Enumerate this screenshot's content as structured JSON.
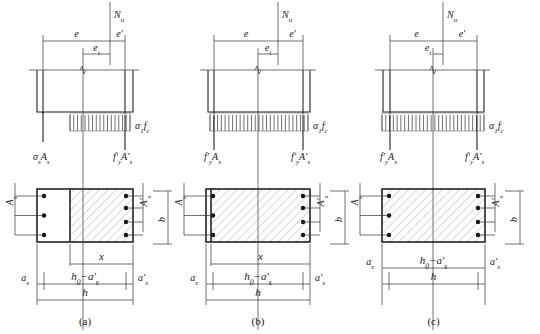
{
  "figure": {
    "panels": [
      {
        "id": "a",
        "caption": "(a)",
        "ox": 0,
        "force": {
          "label_N": "N",
          "label_N_sub": "u",
          "x": 110
        },
        "axis_x": 83,
        "dims_top": {
          "e": "e",
          "e_prime": "e′",
          "e1": "e",
          "e1_sub": "i",
          "left": 43,
          "right": 125,
          "e1_left": 83
        },
        "section_top": {
          "left": 37,
          "right": 133,
          "top": 70,
          "bottom": 112,
          "bar_left": 43,
          "bar_right": 125
        },
        "stress_block": {
          "left": 70,
          "right": 130
        },
        "labels": {
          "left_force": "σ",
          "left_force_sub": "s",
          "left_force_rest": "A",
          "left_force_rest_sub": "s",
          "left_is_tension": true,
          "right_force": "f′",
          "right_force_sub": "y",
          "right_force_rest": "A′",
          "right_force_rest_sub": "s",
          "alpha": "α",
          "alpha_sub": "1",
          "fc": "f",
          "fc_sub": "c"
        },
        "cross_section": {
          "left": 37,
          "right": 133,
          "top": 189,
          "bottom": 242,
          "hatch_left": 70
        },
        "dim_labels": {
          "x": "x",
          "h0a": "h",
          "h0a_sub": "0",
          "h0a_rest": "−a′",
          "h0a_rest_sub": "s",
          "as": "a",
          "as_sub": "s",
          "as_p": "a′",
          "as_p_sub": "s",
          "h": "h",
          "b": "b",
          "As": "A",
          "As_sub": "s",
          "Asp": "A′",
          "Asp_sub": "s"
        }
      },
      {
        "id": "b",
        "caption": "(b)",
        "ox": 180,
        "force": {
          "label_N": "N",
          "label_N_sub": "u",
          "x": 98
        },
        "axis_x": 78,
        "dims_top": {
          "e": "e",
          "e_prime": "e′",
          "e1": "e",
          "e1_sub": "i",
          "left": 34,
          "right": 123,
          "e1_left": 78
        },
        "section_top": {
          "left": 28,
          "right": 130,
          "top": 70,
          "bottom": 112,
          "bar_left": 34,
          "bar_right": 123
        },
        "stress_block": {
          "left": 30,
          "right": 128
        },
        "labels": {
          "left_force": "f′",
          "left_force_sub": "y",
          "left_force_rest": "A",
          "left_force_rest_sub": "s",
          "left_is_tension": false,
          "right_force": "f′",
          "right_force_sub": "y",
          "right_force_rest": "A′",
          "right_force_rest_sub": "s",
          "alpha": "α",
          "alpha_sub": "1",
          "fc": "f",
          "fc_sub": "c"
        },
        "cross_section": {
          "left": 26,
          "right": 130,
          "top": 189,
          "bottom": 242,
          "hatch_left": 31
        },
        "dim_labels": {
          "x": "x",
          "h0a": "h",
          "h0a_sub": "0",
          "h0a_rest": "−a′",
          "h0a_rest_sub": "s",
          "as": "a",
          "as_sub": "s",
          "as_p": "a′",
          "as_p_sub": "s",
          "h": "h",
          "b": "b",
          "As": "A",
          "As_sub": "s",
          "Asp": "A′",
          "Asp_sub": "s"
        }
      },
      {
        "id": "c",
        "caption": "(c)",
        "ox": 360,
        "force": {
          "label_N": "N",
          "label_N_sub": "u",
          "x": 83
        },
        "axis_x": 73,
        "dims_top": {
          "e": "e",
          "e_prime": "e′",
          "e1": "e",
          "e1_sub": "i",
          "left": 30,
          "right": 117,
          "e1_left": 73
        },
        "section_top": {
          "left": 23,
          "right": 124,
          "top": 70,
          "bottom": 112,
          "bar_left": 30,
          "bar_right": 117
        },
        "stress_block": {
          "left": 22,
          "right": 124
        },
        "labels": {
          "left_force": "f′",
          "left_force_sub": "y",
          "left_force_rest": "A",
          "left_force_rest_sub": "s",
          "left_is_tension": false,
          "right_force": "f′",
          "right_force_sub": "y",
          "right_force_rest": "A′",
          "right_force_rest_sub": "s",
          "alpha": "α",
          "alpha_sub": "1",
          "fc": "f",
          "fc_sub": "c"
        },
        "cross_section": {
          "left": 22,
          "right": 125,
          "top": 189,
          "bottom": 242,
          "hatch_left": 22
        },
        "dim_labels": {
          "x": null,
          "h0a": "h",
          "h0a_sub": "0",
          "h0a_rest": "−a′",
          "h0a_rest_sub": "s",
          "as": "a",
          "as_sub": "s",
          "as_p": "a′",
          "as_p_sub": "s",
          "h": "h",
          "b": "b",
          "As": "A",
          "As_sub": "s",
          "Asp": "A′",
          "Asp_sub": "s"
        }
      }
    ]
  }
}
